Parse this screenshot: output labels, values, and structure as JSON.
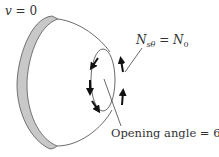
{
  "figure": {
    "boundary_condition_label": {
      "var": "v",
      "eq": " = 0"
    },
    "load_label": {
      "lhs_base": "N",
      "lhs_sub": "sθ",
      "eq": " = ",
      "rhs_base": "N",
      "rhs_sub": "0"
    },
    "opening_label": "Opening angle = 60°",
    "colors": {
      "shell_edge_fill": "#c8c8c8",
      "line": "#444444",
      "arrow": "#111111",
      "text": "#333333"
    },
    "arrows": {
      "left_side_direction": "down",
      "left_side_count": 3,
      "right_side_direction": "up",
      "right_side_count": 2
    }
  }
}
